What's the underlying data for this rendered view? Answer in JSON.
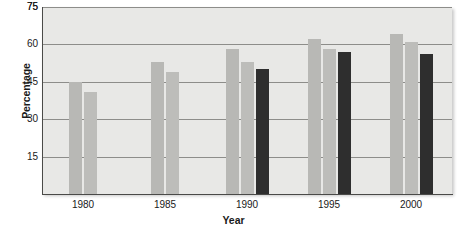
{
  "chart_data": {
    "type": "bar",
    "title": "",
    "xlabel": "Year",
    "ylabel": "Percentage",
    "categories": [
      "1980",
      "1985",
      "1990",
      "1995",
      "2000"
    ],
    "yticks": [
      15,
      30,
      45,
      60,
      75
    ],
    "ylim": [
      0,
      75
    ],
    "grid": true,
    "legend": "none",
    "series": [
      {
        "name": "Series 1",
        "color": "#b8b8b5",
        "values": [
          45,
          53,
          58,
          62,
          64
        ]
      },
      {
        "name": "Series 2",
        "color": "#bdbdba",
        "values": [
          41,
          49,
          53,
          58,
          61
        ]
      },
      {
        "name": "Series 3",
        "color": "#2e2e2e",
        "values": [
          null,
          null,
          50,
          57,
          56
        ]
      }
    ]
  }
}
